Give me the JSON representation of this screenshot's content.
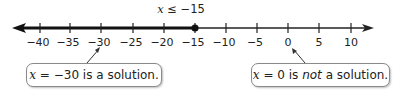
{
  "inequality": {
    "variable": "x",
    "relation": " ≤ −15"
  },
  "number_line": {
    "min_tick": -40,
    "max_tick": 10,
    "step": 5,
    "ticks": [
      "−40",
      "−35",
      "−30",
      "−25",
      "−20",
      "−15",
      "−10",
      "−5",
      "0",
      "5",
      "10"
    ],
    "endpoint": -15,
    "endpoint_type": "closed",
    "shaded_direction": "left",
    "line_color": "#222222"
  },
  "callouts": [
    {
      "variable": "x",
      "prefix": " = −30 is a solution.",
      "emphasis": "",
      "suffix": "",
      "points_to": -30
    },
    {
      "variable": "x",
      "prefix": " = 0 is ",
      "emphasis": "not",
      "suffix": " a solution.",
      "points_to": 0
    }
  ]
}
